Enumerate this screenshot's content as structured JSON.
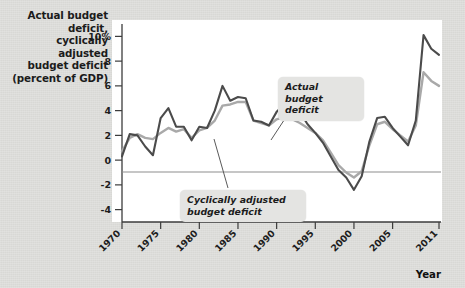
{
  "chart_data": {
    "type": "line",
    "title": "Actual budget deficit, cyclically adjusted budget deficit (percent of GDP)",
    "title_lines": [
      "Actual budget deficit,",
      "cyclically adjusted",
      "budget deficit",
      "(percent of GDP)"
    ],
    "xlabel": "Year",
    "ylabel": "percent of GDP",
    "xlim": [
      1970,
      2011
    ],
    "ylim": [
      -5,
      11
    ],
    "grid": false,
    "legend_position": "annotations-on-plot",
    "y_ticks": [
      {
        "value": 10,
        "label": "10%"
      },
      {
        "value": 8,
        "label": "8"
      },
      {
        "value": 6,
        "label": "6"
      },
      {
        "value": 4,
        "label": "4"
      },
      {
        "value": 2,
        "label": "2"
      },
      {
        "value": 0,
        "label": "0"
      },
      {
        "value": -2,
        "label": "-2"
      },
      {
        "value": -4,
        "label": "-4"
      }
    ],
    "x_ticks": [
      {
        "value": 1970,
        "label": "1970"
      },
      {
        "value": 1975,
        "label": "1975"
      },
      {
        "value": 1980,
        "label": "1980"
      },
      {
        "value": 1985,
        "label": "1985"
      },
      {
        "value": 1990,
        "label": "1990"
      },
      {
        "value": 1995,
        "label": "1995"
      },
      {
        "value": 2000,
        "label": "2000"
      },
      {
        "value": 2005,
        "label": "2005"
      },
      {
        "value": 2011,
        "label": "2011"
      }
    ],
    "zero_line": 0,
    "x": [
      1970,
      1971,
      1972,
      1973,
      1974,
      1975,
      1976,
      1977,
      1978,
      1979,
      1980,
      1981,
      1982,
      1983,
      1984,
      1985,
      1986,
      1987,
      1988,
      1989,
      1990,
      1991,
      1992,
      1993,
      1994,
      1995,
      1996,
      1997,
      1998,
      1999,
      2000,
      2001,
      2002,
      2003,
      2004,
      2005,
      2006,
      2007,
      2008,
      2009,
      2010,
      2011
    ],
    "series": [
      {
        "name": "Actual budget deficit",
        "color": "#4b4b4b",
        "values": [
          0.3,
          2.1,
          2.0,
          1.1,
          0.4,
          3.4,
          4.2,
          2.7,
          2.7,
          1.6,
          2.7,
          2.6,
          4.0,
          6.0,
          4.8,
          5.1,
          5.0,
          3.2,
          3.1,
          2.8,
          3.9,
          4.5,
          4.7,
          3.9,
          2.9,
          2.2,
          1.4,
          0.3,
          -0.8,
          -1.4,
          -2.4,
          -1.3,
          1.5,
          3.4,
          3.5,
          2.6,
          1.9,
          1.2,
          3.2,
          10.1,
          9.0,
          8.5
        ]
      },
      {
        "name": "Cyclically adjusted budget deficit",
        "color": "#a9a9a9",
        "values": [
          0.7,
          1.8,
          2.1,
          1.8,
          1.7,
          2.2,
          2.6,
          2.3,
          2.5,
          1.8,
          2.4,
          2.6,
          3.2,
          4.4,
          4.5,
          4.7,
          4.7,
          3.2,
          3.0,
          2.8,
          3.3,
          3.5,
          3.3,
          3.0,
          2.6,
          2.2,
          1.6,
          0.6,
          -0.4,
          -1.0,
          -1.4,
          -0.9,
          1.2,
          2.9,
          3.1,
          2.5,
          2.0,
          1.5,
          2.8,
          7.1,
          6.4,
          6.0
        ]
      }
    ],
    "annotations": [
      {
        "id": "actual-callout",
        "lines": [
          "Actual budget",
          "deficit"
        ],
        "points_to_year": 2001
      },
      {
        "id": "cyclical-callout",
        "lines": [
          "Cyclically adjusted",
          "budget deficit"
        ],
        "points_to_year": 1985
      }
    ]
  }
}
